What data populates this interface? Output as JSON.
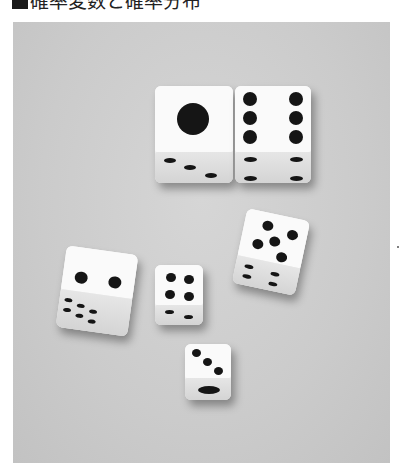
{
  "header": {
    "title": "確率変数と確率分布",
    "bullet": "black-square"
  },
  "photo": {
    "subject": "dice on gray surface",
    "style": "grayscale photograph",
    "dice": [
      {
        "id": "die-large-1",
        "top_face": 1,
        "visible_side": 3
      },
      {
        "id": "die-large-6",
        "top_face": 6,
        "visible_side": 4
      },
      {
        "id": "die-left-2",
        "top_face": 2,
        "visible_side": 6
      },
      {
        "id": "die-mid-4",
        "top_face": 4,
        "visible_side": 2
      },
      {
        "id": "die-right-5",
        "top_face": 5,
        "visible_side": 4
      },
      {
        "id": "die-bottom-3",
        "top_face": 3,
        "visible_side": 1
      }
    ]
  }
}
